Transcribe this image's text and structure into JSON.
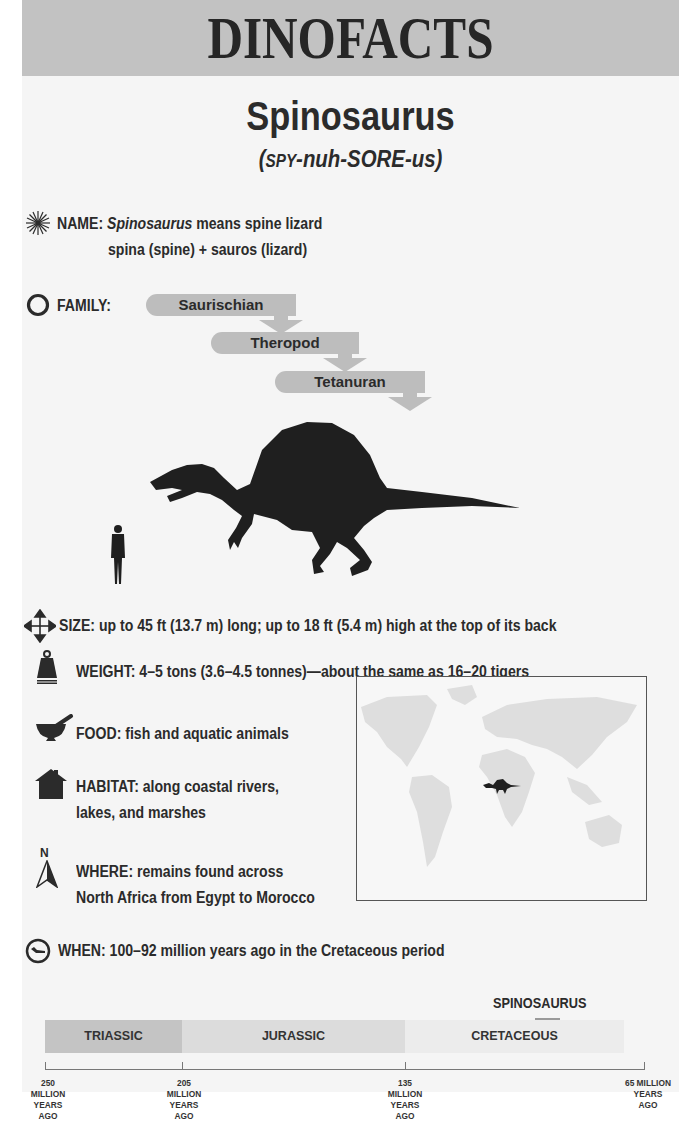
{
  "header": {
    "title": "DINOFACTS"
  },
  "dinosaur": {
    "name": "Spinosaurus",
    "pronunciation_prefix": "(",
    "pronunciation_sc": "SPY",
    "pronunciation_rest": "-nuh-SORE-us)"
  },
  "facts": {
    "name": {
      "label": "NAME:",
      "italic": "Spinosaurus",
      "text": " means spine lizard",
      "line2": "spina (spine) + sauros (lizard)",
      "icon": "starburst-icon"
    },
    "family": {
      "label": "FAMILY:",
      "icon": "circle-icon",
      "levels": [
        "Saurischian",
        "Theropod",
        "Tetanuran"
      ]
    },
    "size": {
      "label": "SIZE:",
      "text": " up to 45 ft (13.7 m) long; up to 18 ft (5.4 m) high at the top of its back",
      "icon": "four-way-arrow-icon"
    },
    "weight": {
      "label": "WEIGHT:",
      "text": " 4–5 tons (3.6–4.5 tonnes)—about the same as 16–20 tigers",
      "icon": "weight-icon"
    },
    "food": {
      "label": "FOOD:",
      "text": " fish and aquatic animals",
      "icon": "mortar-pestle-icon"
    },
    "habitat": {
      "label": "HABITAT:",
      "text": " along coastal rivers,",
      "line2": "lakes, and marshes",
      "icon": "house-icon"
    },
    "where": {
      "label": "WHERE:",
      "text": " remains found across",
      "line2": "North Africa from Egypt to Morocco",
      "icon": "north-arrow-icon",
      "icon_letter": "N"
    },
    "when": {
      "label": "WHEN:",
      "text": " 100–92 million years ago in the Cretaceous period",
      "icon": "clock-dino-icon"
    }
  },
  "timeline": {
    "marker_label": "SPINOSAURUS",
    "periods": [
      {
        "name": "TRIASSIC",
        "color": "#c4c4c4"
      },
      {
        "name": "JURASSIC",
        "color": "#dcdcdc"
      },
      {
        "name": "CRETACEOUS",
        "color": "#ececec"
      }
    ],
    "ticks": [
      {
        "line1": "250 MILLION",
        "line2": "YEARS AGO"
      },
      {
        "line1": "205 MILLION",
        "line2": "YEARS AGO"
      },
      {
        "line1": "135 MILLION",
        "line2": "YEARS AGO"
      },
      {
        "line1": "65 MILLION",
        "line2": "YEARS AGO"
      }
    ]
  },
  "colors": {
    "header_bg": "#c2c2c2",
    "page_bg": "#f5f5f5",
    "text": "#2b2b2b",
    "silhouette": "#1f1f1f",
    "family_box": "#bdbdbd"
  }
}
